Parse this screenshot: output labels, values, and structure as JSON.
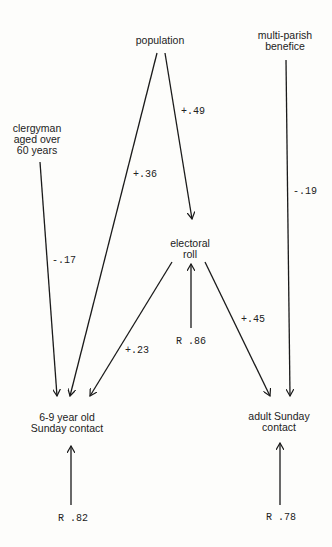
{
  "nodes": {
    "population": "population",
    "multi_parish_1": "multi-parish",
    "multi_parish_2": "benefice",
    "clergyman_1": "clergyman",
    "clergyman_2": "aged over",
    "clergyman_3": "60 years",
    "electoral_1": "electoral",
    "electoral_2": "roll",
    "child_1": "6-9 year old",
    "child_2": "Sunday contact",
    "adult_1": "adult Sunday",
    "adult_2": "contact"
  },
  "paths": [
    {
      "from": "population",
      "to": "6-9 year old Sunday contact",
      "coef": "+.36"
    },
    {
      "from": "population",
      "to": "electoral roll",
      "coef": "+.49"
    },
    {
      "from": "multi-parish benefice",
      "to": "adult Sunday contact",
      "coef": "-.19"
    },
    {
      "from": "clergyman aged over 60 years",
      "to": "6-9 year old Sunday contact",
      "coef": "-.17"
    },
    {
      "from": "electoral roll",
      "to": "6-9 year old Sunday contact",
      "coef": "+.23"
    },
    {
      "from": "electoral roll",
      "to": "adult Sunday contact",
      "coef": "+.45"
    }
  ],
  "residuals": {
    "electoral": "R .86",
    "child": "R .82",
    "adult": "R .78"
  },
  "colors": {
    "line": "#1a1a1a",
    "background": "#fdfdfb"
  }
}
